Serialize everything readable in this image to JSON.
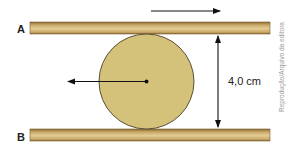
{
  "diagram": {
    "plank_a": {
      "label": "A"
    },
    "plank_b": {
      "label": "B"
    },
    "distance_label": "4,0 cm",
    "credit": "Reprodução/Arquivo da editora",
    "colors": {
      "plank_light": "#e3cc93",
      "plank_mid": "#c9a968",
      "plank_dark": "#8a6a35",
      "cylinder_fill": "#d4c27a",
      "cylinder_stroke": "#5a5038",
      "arrow": "#111111",
      "credit": "#9a9a9a"
    }
  }
}
